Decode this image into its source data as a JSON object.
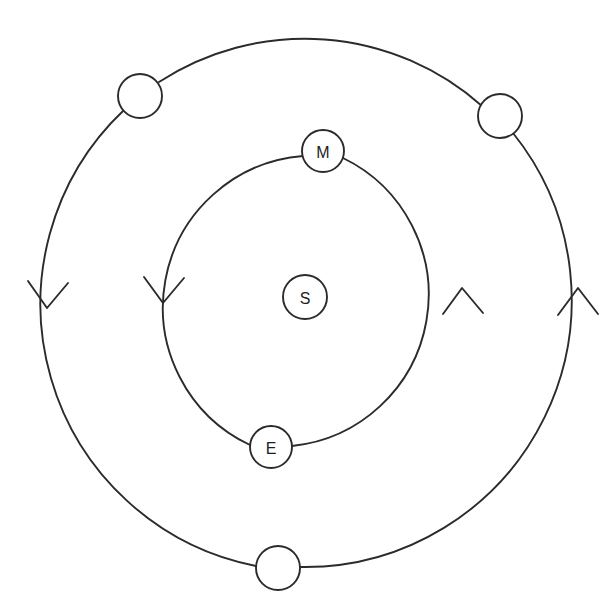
{
  "diagram": {
    "background_color": "#ffffff",
    "stroke_color": "#2b2b2b",
    "label_color": "#1d1d1d",
    "center": {
      "x": 312,
      "y": 301
    },
    "orbits": [
      {
        "name": "inner-orbit",
        "radius": 152,
        "direction": "counterclockwise",
        "bodies": [
          "M",
          "E"
        ]
      },
      {
        "name": "outer-orbit",
        "radius": 267,
        "direction": "counterclockwise",
        "bodies": [
          "",
          "",
          ""
        ]
      }
    ],
    "bodies": [
      {
        "id": "sun",
        "label": "S",
        "orbit": "center",
        "cx": 305,
        "cy": 297,
        "r": 22
      },
      {
        "id": "mercury",
        "label": "M",
        "orbit": "inner-orbit",
        "cx": 323,
        "cy": 151,
        "r": 21
      },
      {
        "id": "earth",
        "label": "E",
        "orbit": "inner-orbit",
        "cx": 271,
        "cy": 447,
        "r": 21
      },
      {
        "id": "outer-upper-left",
        "label": "",
        "orbit": "outer-orbit",
        "cx": 140,
        "cy": 96,
        "r": 22
      },
      {
        "id": "outer-upper-right",
        "label": "",
        "orbit": "outer-orbit",
        "cx": 500,
        "cy": 116,
        "r": 22
      },
      {
        "id": "outer-bottom",
        "label": "",
        "orbit": "outer-orbit",
        "cx": 278,
        "cy": 568,
        "r": 22
      }
    ],
    "arrows": [
      {
        "id": "outer-left-arrow",
        "orbit": "outer-orbit",
        "apex_x": 47,
        "apex_y": 308,
        "points": "down",
        "meaning": "counterclockwise motion"
      },
      {
        "id": "inner-left-arrow",
        "orbit": "inner-orbit",
        "apex_x": 163,
        "apex_y": 303,
        "points": "down",
        "meaning": "counterclockwise motion"
      },
      {
        "id": "inner-right-arrow",
        "orbit": "inner-orbit",
        "apex_x": 462,
        "apex_y": 288,
        "points": "up",
        "meaning": "counterclockwise motion"
      },
      {
        "id": "outer-right-arrow",
        "orbit": "outer-orbit",
        "apex_x": 578,
        "apex_y": 288,
        "points": "up",
        "meaning": "counterclockwise motion"
      }
    ]
  }
}
